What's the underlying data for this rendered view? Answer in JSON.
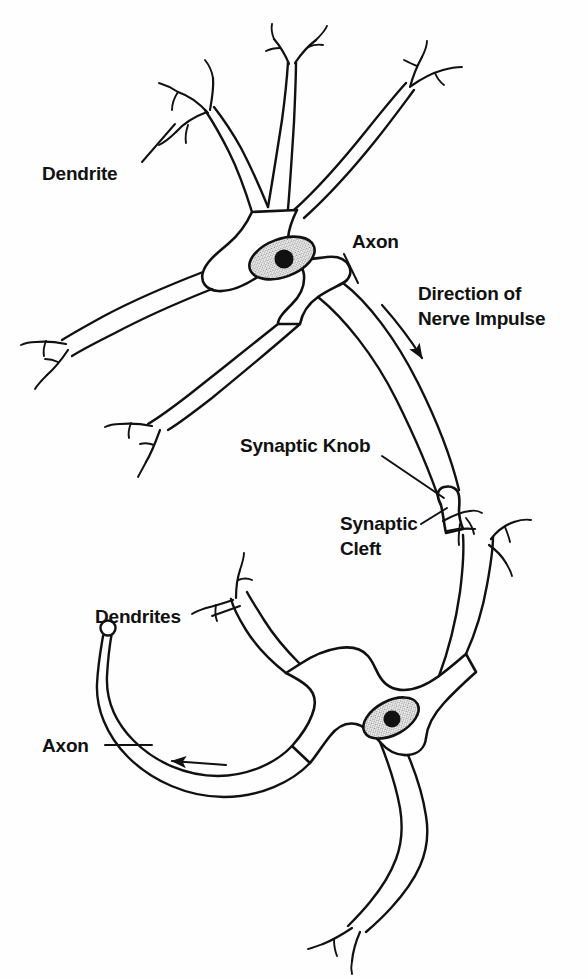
{
  "figure": {
    "background_color": "#fefefe",
    "ink_color": "#111111",
    "nucleus_fill_color": "#c9c9c9",
    "width": 588,
    "height": 979
  },
  "labels": {
    "dendrite_top": "Dendrite",
    "axon_top": "Axon",
    "direction_line1": "Direction of",
    "direction_line2": "Nerve Impulse",
    "synaptic_knob": "Synaptic Knob",
    "synaptic_cleft_line1": "Synaptic",
    "synaptic_cleft_line2": "Cleft",
    "dendrites_bottom": "Dendrites",
    "axon_bottom": "Axon"
  },
  "structures": {
    "neuron_upper": {
      "name": "Presynaptic Neuron",
      "dendrite_count": 5,
      "has_nucleus": true,
      "has_nucleolus": true,
      "axon_direction": "down-right"
    },
    "neuron_lower": {
      "name": "Postsynaptic Neuron",
      "dendrite_count": 3,
      "has_nucleus": true,
      "has_nucleolus": true,
      "axon_direction": "left"
    },
    "synapse": {
      "knob_type": "terminal bouton",
      "cleft": "gap between knob and dendrite"
    }
  },
  "annotations": {
    "arrow_upper_axon": "impulse flows down the axon toward the synaptic knob",
    "arrow_lower_axon": "impulse flows left along the axon"
  }
}
